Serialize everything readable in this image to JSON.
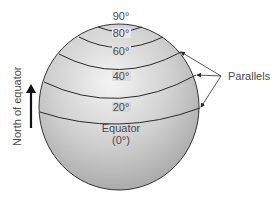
{
  "diagram": {
    "type": "globe-parallels",
    "latitude_labels": [
      "90°",
      "80°",
      "60°",
      "40°",
      "20°"
    ],
    "equator_label": "Equator",
    "equator_value": "(0°)",
    "parallels_label": "Parallels",
    "direction_label": "North of equator",
    "colors": {
      "globe_light": "#f2f2f2",
      "globe_dark": "#a8a8a8",
      "line": "#2a2a2a",
      "text": "#4a4a4a"
    }
  }
}
